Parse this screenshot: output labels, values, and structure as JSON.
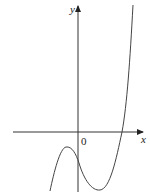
{
  "figure": {
    "type": "function-graph",
    "axes": {
      "x_label": "x",
      "y_label": "y",
      "origin_label": "0"
    },
    "colors": {
      "axis": "#333333",
      "curve": "#444444",
      "background": "#ffffff"
    }
  }
}
